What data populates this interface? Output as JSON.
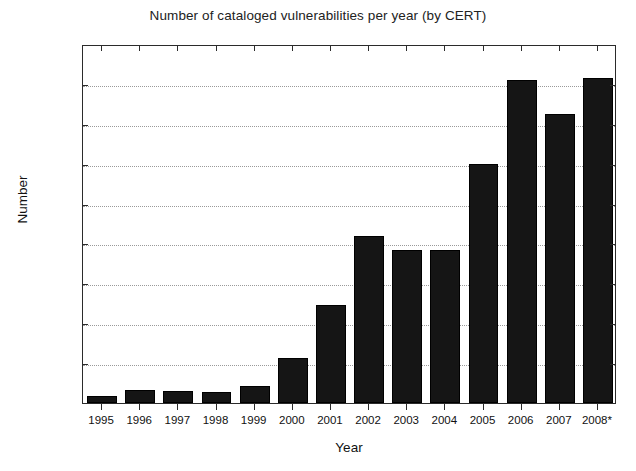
{
  "chart_data": {
    "type": "bar",
    "title": "Number of cataloged vulnerabilities per year (by CERT)",
    "xlabel": "Year",
    "ylabel": "Number",
    "categories": [
      "1995",
      "1996",
      "1997",
      "1998",
      "1999",
      "2000",
      "2001",
      "2002",
      "2003",
      "2004",
      "2005",
      "2006",
      "2007",
      "2008*"
    ],
    "values": [
      170,
      320,
      300,
      270,
      420,
      1130,
      2455,
      4190,
      3840,
      3840,
      6000,
      8100,
      7250,
      8150
    ],
    "ylim": [
      0,
      9000
    ],
    "yticks": [
      0,
      1000,
      2000,
      3000,
      4000,
      5000,
      6000,
      7000,
      8000,
      9000
    ],
    "ytick_labels": [
      "0",
      "1000",
      "2000",
      "3000",
      "4000",
      "5000",
      "6000",
      "7000",
      "8000",
      "9000"
    ],
    "grid": true,
    "grid_axis": "y",
    "grid_style": "dotted",
    "legend": null,
    "legend_position": "none",
    "bar_color": "#151515",
    "axis_color": "#2b2b2b",
    "grid_color": "#9a9a9a",
    "background": "#ffffff",
    "annotations": [
      {
        "text": "*",
        "meaning": "asterisk on final year label 2008 indicates partial-year or provisional data"
      }
    ]
  }
}
